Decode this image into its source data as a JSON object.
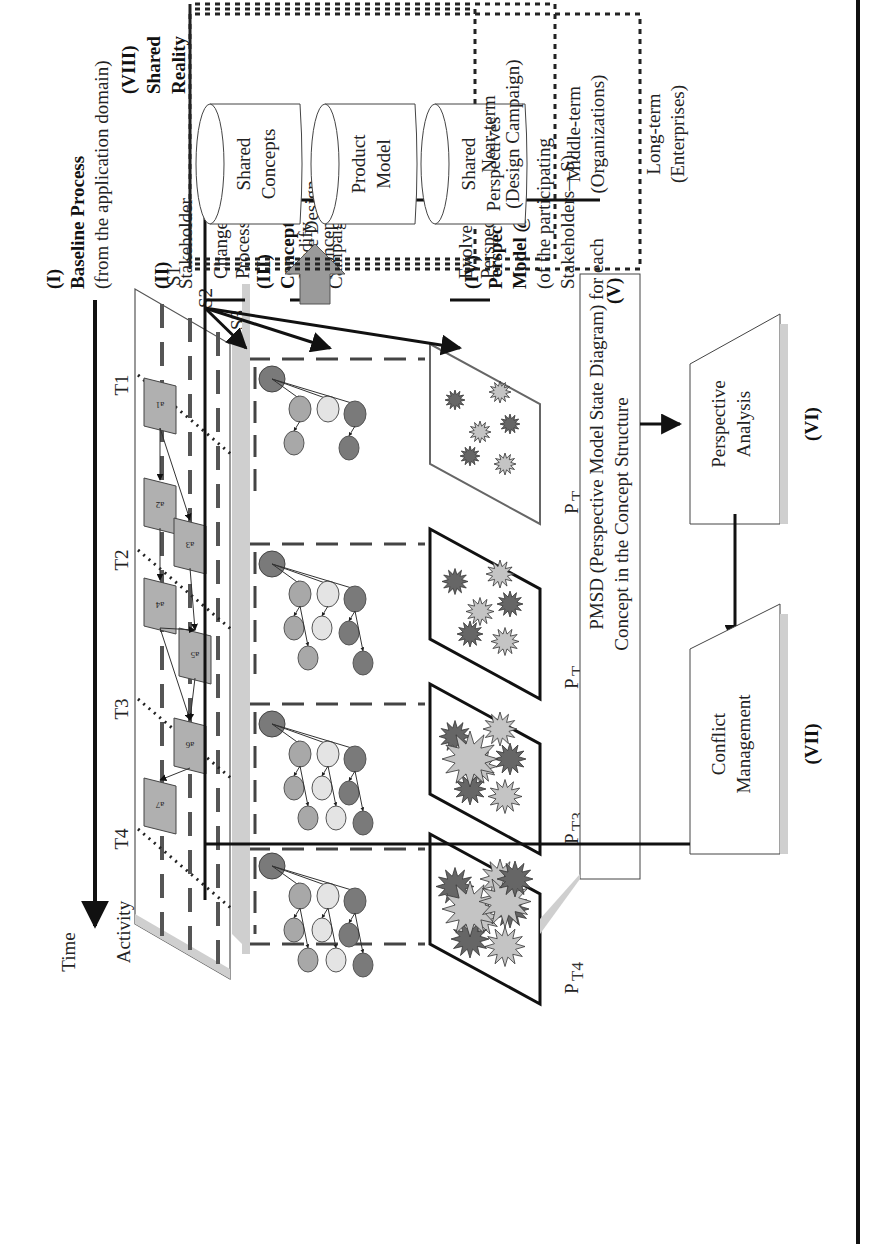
{
  "layers": {
    "baseline": {
      "roman": "(I)",
      "title": "Baseline Process",
      "subtitle": "(from the application domain)"
    },
    "stakeholder": {
      "roman": "(II)",
      "title": "Stakeholder"
    },
    "concept": {
      "roman": "(III)",
      "title": "Concept Structure",
      "subtitle_1": "(of the Design",
      "subtitle_2": "Campaign)"
    },
    "perspective": {
      "roman": "(IV)",
      "title_1": "Perspective",
      "title_2": "Model @ “t”",
      "subtitle_1": "(of the participating",
      "subtitle_2": "Stakeholders—S)"
    }
  },
  "axis": {
    "time_label": "Time",
    "activity_label": "Activity",
    "time_points": [
      "T1",
      "T2",
      "T3",
      "T4"
    ],
    "stakeholders": [
      "S1",
      "S2",
      "S3"
    ]
  },
  "activities": [
    "a1",
    "a2",
    "a3",
    "a4",
    "a5",
    "a6",
    "a7"
  ],
  "perspective_models": [
    {
      "label": "P",
      "sub": "T",
      "num": "1"
    },
    {
      "label": "P",
      "sub": "T",
      "num": "2"
    },
    {
      "label": "P",
      "sub": "T3",
      "num": ""
    },
    {
      "label": "P",
      "sub": "T4",
      "num": ""
    }
  ],
  "feedback": {
    "change_process_1": "Change",
    "change_process_2": "Process",
    "modify_concepts_1": "Modify",
    "modify_concepts_2": "Concepts",
    "evolve_perspectives_1": "Evolve",
    "evolve_perspectives_2": "Perspectives"
  },
  "pmsd": {
    "roman": "(V)",
    "line_1": "PMSD (Perspective Model State Diagram) for each",
    "line_2": "Concept in the Concept Structure"
  },
  "analysis": {
    "roman": "(VI)",
    "line_1": "Perspective",
    "line_2": "Analysis"
  },
  "conflict": {
    "roman": "(VII)",
    "line_1": "Conflict",
    "line_2": "Management"
  },
  "shared_reality": {
    "roman": "(VIII)",
    "title_1": "Shared",
    "title_2": "Reality",
    "stores": [
      {
        "line_1": "Shared",
        "line_2": "Concepts"
      },
      {
        "line_1": "Product",
        "line_2": "Model"
      },
      {
        "line_1": "Shared",
        "line_2": "Perspectives"
      }
    ],
    "terms": [
      {
        "line_1": "Near-term",
        "line_2": "(Design Campaign)"
      },
      {
        "line_1": "Middle-term",
        "line_2": "(Organizations)"
      },
      {
        "line_1": "Long-term",
        "line_2": "(Enterprises)"
      }
    ]
  },
  "colors": {
    "dark_node": "#7a7a7a",
    "mid_node": "#a8a8a8",
    "light_node": "#e4e4e4",
    "dark_star": "#666666",
    "light_star": "#c4c4c4",
    "activity_box": "#b0b0b0",
    "shadow": "#cfcfcf",
    "big_arrow": "#9a9a9a"
  }
}
